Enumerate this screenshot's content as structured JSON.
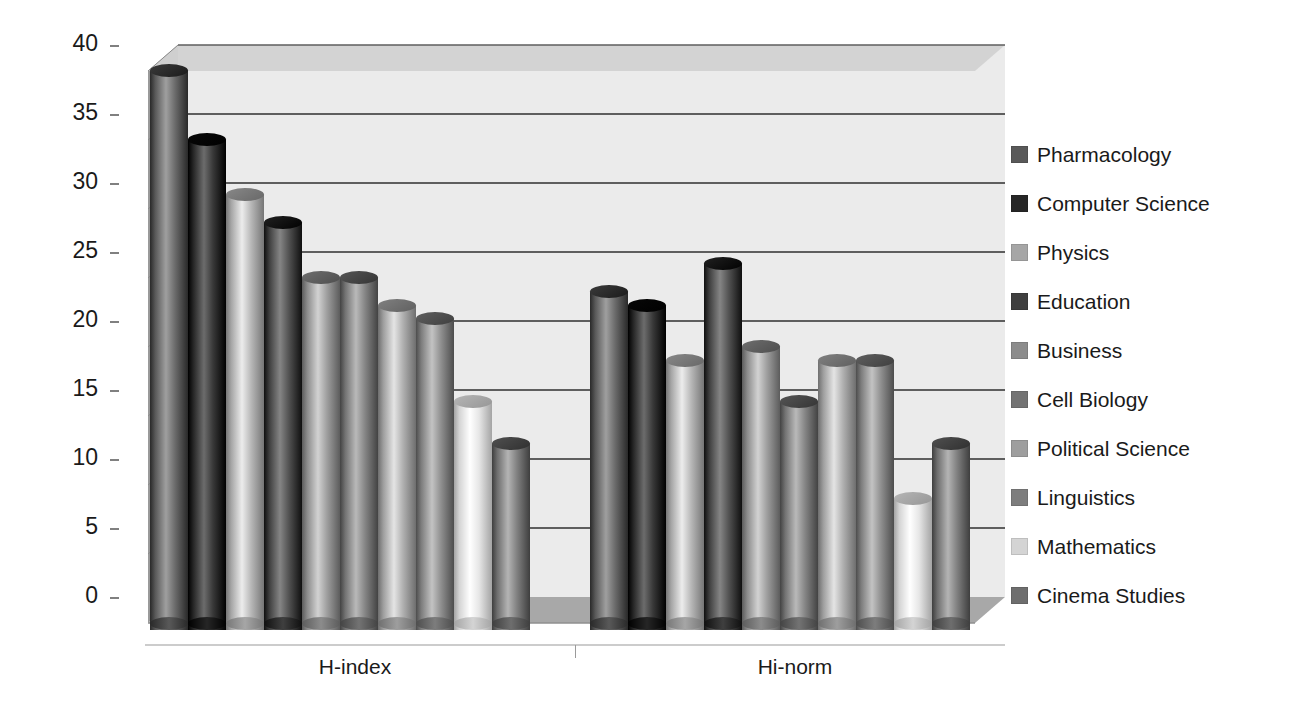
{
  "chart_data": {
    "type": "bar",
    "title": "",
    "subtitle": "",
    "xlabel": "",
    "ylabel": "",
    "categories": [
      "H-index",
      "Hi-norm"
    ],
    "ylim": [
      0,
      40
    ],
    "ytick_labels": [
      "0",
      "5",
      "10",
      "15",
      "20",
      "25",
      "30",
      "35",
      "40"
    ],
    "ytick_values": [
      0,
      5,
      10,
      15,
      20,
      25,
      30,
      35,
      40
    ],
    "grid": true,
    "legend_position": "right",
    "style": "3d-cylinder",
    "series": [
      {
        "name": "Pharmacology",
        "color": "#595959",
        "values": [
          40,
          24
        ]
      },
      {
        "name": "Computer Science",
        "color": "#262626",
        "values": [
          35,
          23
        ]
      },
      {
        "name": "Physics",
        "color": "#a6a6a6",
        "values": [
          31,
          19
        ]
      },
      {
        "name": "Education",
        "color": "#3f3f3f",
        "values": [
          29,
          26
        ]
      },
      {
        "name": "Business",
        "color": "#8c8c8c",
        "values": [
          25,
          20
        ]
      },
      {
        "name": "Cell Biology",
        "color": "#737373",
        "values": [
          25,
          16
        ]
      },
      {
        "name": "Political Science",
        "color": "#9e9e9e",
        "values": [
          23,
          19
        ]
      },
      {
        "name": "Linguistics",
        "color": "#7d7d7d",
        "values": [
          22,
          19
        ]
      },
      {
        "name": "Mathematics",
        "color": "#d4d4d4",
        "values": [
          16,
          9
        ]
      },
      {
        "name": "Cinema Studies",
        "color": "#6e6e6e",
        "values": [
          13,
          13
        ]
      }
    ]
  },
  "axis": {
    "y_ticks": [
      "40",
      "35",
      "30",
      "25",
      "20",
      "15",
      "10",
      "5",
      "0"
    ],
    "x_group_labels": [
      "H-index",
      "Hi-norm"
    ]
  },
  "legend": {
    "items": [
      {
        "label": "Pharmacology",
        "color": "#595959"
      },
      {
        "label": "Computer Science",
        "color": "#262626"
      },
      {
        "label": "Physics",
        "color": "#a6a6a6"
      },
      {
        "label": "Education",
        "color": "#3f3f3f"
      },
      {
        "label": "Business",
        "color": "#8c8c8c"
      },
      {
        "label": "Cell Biology",
        "color": "#737373"
      },
      {
        "label": "Political Science",
        "color": "#9e9e9e"
      },
      {
        "label": "Linguistics",
        "color": "#7d7d7d"
      },
      {
        "label": "Mathematics",
        "color": "#d4d4d4"
      },
      {
        "label": "Cinema Studies",
        "color": "#6e6e6e"
      }
    ]
  },
  "colors": {
    "background": "#ffffff",
    "wall": "#ebebeb",
    "wall_top": "#d2d2d2",
    "side_wall": "#9a9a9a",
    "floor": "#a8a8a8",
    "gridline": "#5e5e5e",
    "text": "#1a1a1a",
    "tick": "#808080"
  }
}
